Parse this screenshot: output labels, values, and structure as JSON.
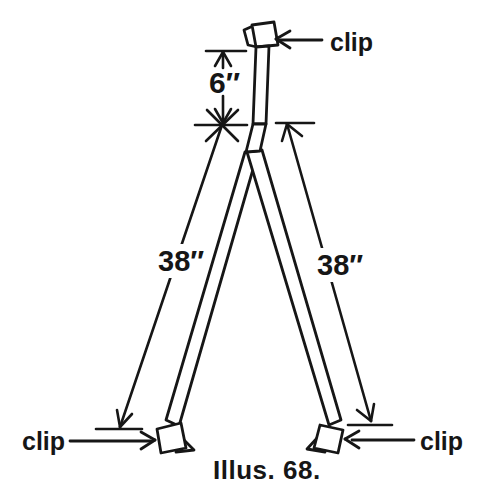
{
  "figure": {
    "caption": "Illus. 68.",
    "labels": {
      "top_clip": "clip",
      "bottom_left_clip": "clip",
      "bottom_right_clip": "clip"
    },
    "dimensions": {
      "mast": "6″",
      "left_leg": "38″",
      "right_leg": "38″"
    },
    "colors": {
      "ink": "#161616",
      "paper": "#ffffff"
    }
  }
}
